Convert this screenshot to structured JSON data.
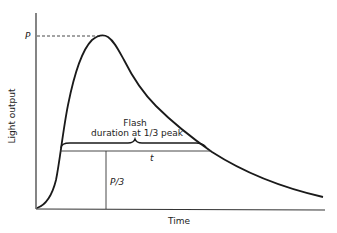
{
  "diagram": {
    "title": "",
    "axes": {
      "x_label": "Time",
      "y_label": "Light output"
    },
    "annotations": {
      "peak_label": "P",
      "third_peak_label": "P/3",
      "duration_label": "t",
      "brace_label_line1": "Flash",
      "brace_label_line2": "duration at 1/3 peak"
    },
    "colors": {
      "stroke": "#1a1a1a",
      "thin_stroke": "#333333",
      "background": "#ffffff"
    }
  }
}
